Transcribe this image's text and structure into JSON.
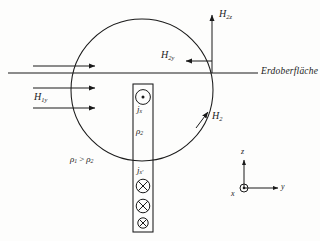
{
  "figure": {
    "ink_color": "#1a1a1a",
    "background_color": "#fdfdfc"
  },
  "labels": {
    "surface": "Erdoberfläche",
    "h1y": "H",
    "h1y_sub": "1y",
    "h2z": "H",
    "h2z_sub": "2z",
    "h2y": "H",
    "h2y_sub": "2y",
    "h2": "H",
    "h2_sub": "2",
    "jx": "j",
    "jx_sub": "x",
    "jx_prime": "j",
    "jx_prime_sub": "x'",
    "rho2": "ρ",
    "rho2_sub": "2",
    "rho_compare": "ρ",
    "rho_compare_sub1": "1",
    "rho_compare_op": ">",
    "rho_compare_sub2": "2"
  },
  "axes": {
    "z": "z",
    "y": "y",
    "x": "x"
  },
  "geometry": {
    "circle_center_x": 142,
    "circle_center_y": 90,
    "circle_radius": 71,
    "surface_line_y": 73,
    "surface_line_x1": 8,
    "surface_line_x2": 258,
    "bar_x": 133,
    "bar_width": 20,
    "bar_top": 84,
    "bar_bottom": 232
  },
  "current_symbols": {
    "out_of_page_count": 1,
    "into_page_count": 3,
    "out_of_page_glyph": "dot-in-circle",
    "into_page_glyph": "cross-in-circle"
  },
  "field_arrows": {
    "h1y_arrow_count": 3,
    "h1y_direction": "right",
    "h2z_direction": "up",
    "h2y_direction": "left",
    "h2_direction": "tangent-up-right"
  },
  "icons": {
    "current_out": "circle-dot-icon",
    "current_in": "circle-cross-icon",
    "axis_x_out": "circle-dot-icon"
  }
}
